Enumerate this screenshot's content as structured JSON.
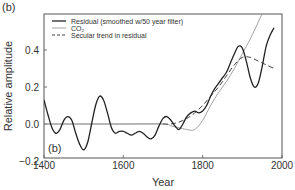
{
  "panel_label_outer": "(b)",
  "panel_label_inner": "(b)",
  "chart_data": {
    "type": "line",
    "title": "",
    "xlabel": "Year",
    "ylabel": "Relative amplitude",
    "xlim": [
      1400,
      2000
    ],
    "ylim": [
      -0.2,
      0.59
    ],
    "xticks": [
      1400,
      1600,
      1800,
      2000
    ],
    "xtick_labels": [
      "1400",
      "1600",
      "1800",
      "2000"
    ],
    "yticks": [
      -0.2,
      0.0,
      0.2,
      0.4
    ],
    "ytick_labels": [
      "−0.2",
      "0.0",
      "0.2",
      "0.4"
    ],
    "grid": false,
    "legend_position": "upper left",
    "legend": [
      {
        "label": "Residual (smoothed w/50 year filter)",
        "style": "solid-thick",
        "color": "#222222"
      },
      {
        "label": "CO2",
        "label_display": "CO₂",
        "style": "solid-thin",
        "color": "#8a8a8a"
      },
      {
        "label": "Secular trend in residual",
        "style": "dashed",
        "color": "#444444"
      }
    ],
    "series": [
      {
        "name": "Residual (smoothed w/50 year filter)",
        "x": [
          1400,
          1410,
          1420,
          1430,
          1440,
          1450,
          1460,
          1470,
          1480,
          1490,
          1500,
          1510,
          1520,
          1530,
          1540,
          1550,
          1560,
          1570,
          1580,
          1590,
          1600,
          1610,
          1620,
          1630,
          1640,
          1650,
          1660,
          1670,
          1680,
          1690,
          1700,
          1710,
          1720,
          1730,
          1740,
          1750,
          1760,
          1770,
          1780,
          1790,
          1800,
          1810,
          1820,
          1830,
          1840,
          1850,
          1860,
          1870,
          1880,
          1890,
          1900,
          1910,
          1920,
          1930,
          1940,
          1950,
          1960,
          1970,
          1980
        ],
        "y": [
          0.13,
          0.05,
          -0.02,
          -0.05,
          -0.03,
          0.02,
          0.04,
          0.02,
          -0.05,
          -0.11,
          -0.14,
          -0.1,
          0.0,
          0.1,
          0.15,
          0.13,
          0.06,
          -0.02,
          -0.05,
          -0.04,
          -0.04,
          -0.05,
          -0.06,
          -0.05,
          -0.04,
          -0.05,
          -0.07,
          -0.08,
          -0.06,
          -0.01,
          0.03,
          0.04,
          0.02,
          -0.01,
          -0.03,
          0.0,
          0.04,
          0.06,
          0.07,
          0.06,
          0.07,
          0.1,
          0.15,
          0.19,
          0.22,
          0.25,
          0.28,
          0.33,
          0.38,
          0.42,
          0.41,
          0.34,
          0.25,
          0.2,
          0.22,
          0.31,
          0.42,
          0.48,
          0.52
        ]
      },
      {
        "name": "CO2",
        "x": [
          1400,
          1500,
          1600,
          1700,
          1720,
          1740,
          1760,
          1780,
          1800,
          1820,
          1840,
          1860,
          1880,
          1900,
          1920,
          1940,
          1960,
          1975
        ],
        "y": [
          0.0,
          0.0,
          0.0,
          0.0,
          -0.01,
          -0.02,
          -0.03,
          -0.03,
          0.02,
          0.1,
          0.17,
          0.23,
          0.3,
          0.38,
          0.46,
          0.55,
          0.65,
          0.75
        ]
      },
      {
        "name": "Secular trend in residual",
        "x": [
          1700,
          1720,
          1740,
          1760,
          1780,
          1800,
          1820,
          1840,
          1860,
          1880,
          1900,
          1920,
          1940,
          1960,
          1980
        ],
        "y": [
          0.0,
          0.0,
          0.01,
          0.03,
          0.06,
          0.1,
          0.15,
          0.2,
          0.26,
          0.32,
          0.36,
          0.36,
          0.34,
          0.32,
          0.3
        ]
      }
    ]
  }
}
